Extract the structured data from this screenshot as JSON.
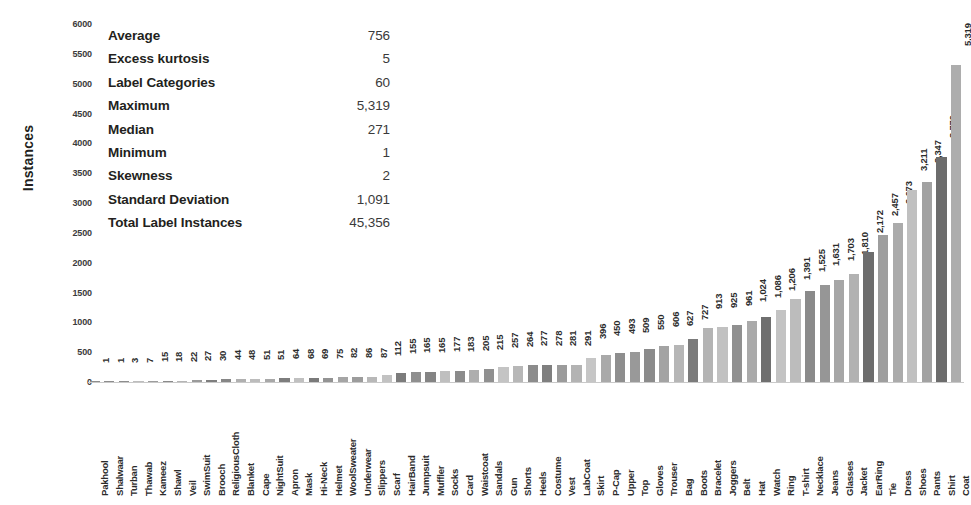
{
  "chart_data": {
    "type": "bar",
    "title": "",
    "subtitle": "",
    "xlabel": "",
    "ylabel": "Instances",
    "ylim": [
      0,
      6000
    ],
    "grid": false,
    "legend": "none",
    "y_ticks": [
      0,
      500,
      1000,
      1500,
      2000,
      2500,
      3000,
      3500,
      4000,
      4500,
      5000,
      5500,
      6000
    ],
    "y_tick_labels": [
      "0",
      "500",
      "1000",
      "1500",
      "2000",
      "2500",
      "3000",
      "3500",
      "4000",
      "4500",
      "5000",
      "5500",
      "6000"
    ],
    "categories": [
      "Pakhool",
      "Shalwaar",
      "Turban",
      "Thawab",
      "Kameez",
      "Shawl",
      "Veil",
      "SwimSuit",
      "Brooch",
      "ReligiousCloth",
      "Blanket",
      "Cape",
      "NightSuit",
      "Apron",
      "Mask",
      "Hi-Neck",
      "Helmet",
      "WoolSweater",
      "Underwear",
      "Slippers",
      "Scarf",
      "HairBand",
      "Jumpsuit",
      "Muffler",
      "Socks",
      "Card",
      "Waistcoat",
      "Sandals",
      "Gun",
      "Shorts",
      "Heels",
      "Costume",
      "Vest",
      "LabCoat",
      "Skirt",
      "P-Cap",
      "Upper",
      "Top",
      "Gloves",
      "Trouser",
      "Bag",
      "Boots",
      "Bracelet",
      "Joggers",
      "Belt",
      "Hat",
      "Watch",
      "Ring",
      "T-shirt",
      "Necklace",
      "Jeans",
      "Glasses",
      "Jacket",
      "EarRing",
      "Tie",
      "Dress",
      "Shoes",
      "Pants",
      "Shirt",
      "Coat"
    ],
    "values": [
      1,
      1,
      3,
      7,
      15,
      18,
      22,
      27,
      30,
      44,
      48,
      51,
      51,
      64,
      68,
      69,
      75,
      82,
      86,
      87,
      112,
      155,
      165,
      165,
      177,
      183,
      205,
      215,
      257,
      264,
      277,
      278,
      281,
      291,
      396,
      450,
      493,
      509,
      550,
      606,
      627,
      727,
      913,
      925,
      961,
      1024,
      1086,
      1206,
      1391,
      1525,
      1631,
      1703,
      1810,
      2172,
      2457,
      2673,
      3211,
      3347,
      3770,
      5319
    ],
    "value_labels": [
      "1",
      "1",
      "3",
      "7",
      "15",
      "18",
      "22",
      "27",
      "30",
      "44",
      "48",
      "51",
      "51",
      "64",
      "68",
      "69",
      "75",
      "82",
      "86",
      "87",
      "112",
      "155",
      "165",
      "165",
      "177",
      "183",
      "205",
      "215",
      "257",
      "264",
      "277",
      "278",
      "281",
      "291",
      "396",
      "450",
      "493",
      "509",
      "550",
      "606",
      "627",
      "727",
      "913",
      "925",
      "961",
      "1,024",
      "1,086",
      "1,206",
      "1,391",
      "1,525",
      "1,631",
      "1,703",
      "1,810",
      "2,172",
      "2,457",
      "2,673",
      "3,211",
      "3,347",
      "3,770",
      "5,319"
    ],
    "bar_colors": [
      "#8d8d8d",
      "#8d8d8d",
      "#8d8d8d",
      "#bdbdbd",
      "#9d9d9d",
      "#8a8a8a",
      "#b5b5b5",
      "#9a9a9a",
      "#7e7e7e",
      "#868686",
      "#b0b0b0",
      "#bcbcbc",
      "#a8a8a8",
      "#7d7d7d",
      "#c0c0c0",
      "#7a7a7a",
      "#939393",
      "#a5a5a5",
      "#9c9c9c",
      "#b8b8b8",
      "#c2c2c2",
      "#7c7c7c",
      "#8f8f8f",
      "#848484",
      "#bfbfbf",
      "#8b8b8b",
      "#aeaeae",
      "#909090",
      "#c4c4c4",
      "#b7b7b7",
      "#8c8c8c",
      "#7f7f7f",
      "#9b9b9b",
      "#b3b3b3",
      "#c6c6c6",
      "#a9a9a9",
      "#8e8e8e",
      "#999999",
      "#8b8b8b",
      "#a3a3a3",
      "#b6b6b6",
      "#7b7b7b",
      "#b4b4b4",
      "#c1c1c1",
      "#909090",
      "#aaaaaa",
      "#6f6f6f",
      "#c3c3c3",
      "#bcbcbc",
      "#8a8a8a",
      "#969696",
      "#a6a6a6",
      "#b2b2b2",
      "#6d6d6d",
      "#9e9e9e",
      "#ababab",
      "#c0c0c0",
      "#a2a2a2",
      "#6c6c6c",
      "#adadad"
    ]
  },
  "stats": {
    "rows": [
      {
        "label": "Average",
        "value": "756"
      },
      {
        "label": "Excess kurtosis",
        "value": "5"
      },
      {
        "label": "Label Categories",
        "value": "60"
      },
      {
        "label": "Maximum",
        "value": "5,319"
      },
      {
        "label": "Median",
        "value": "271"
      },
      {
        "label": "Minimum",
        "value": "1"
      },
      {
        "label": "Skewness",
        "value": "2"
      },
      {
        "label": "Standard Deviation",
        "value": "1,091"
      },
      {
        "label": "Total Label Instances",
        "value": "45,356"
      }
    ]
  }
}
